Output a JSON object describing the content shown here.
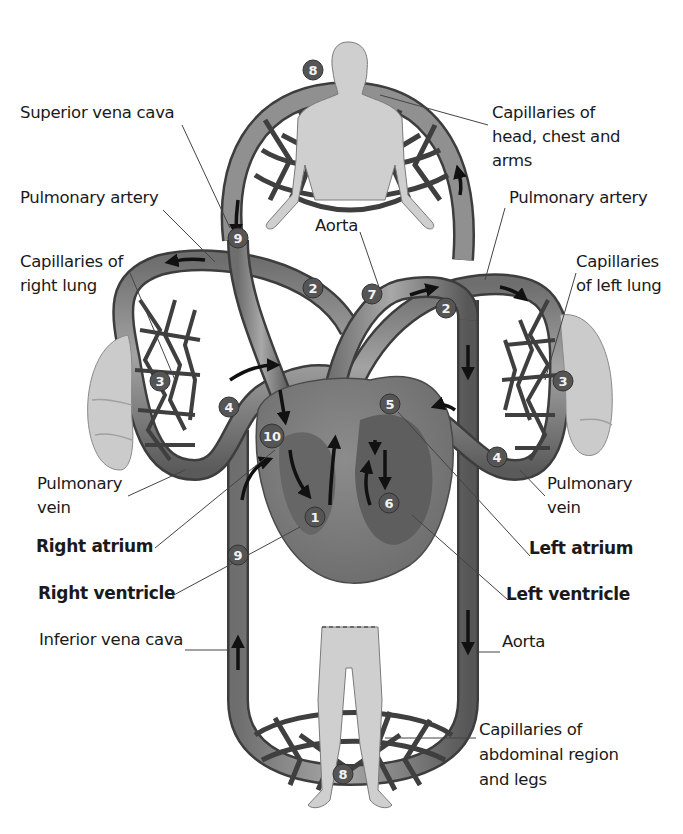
{
  "diagram": {
    "palette": {
      "background": "#ffffff",
      "vessel": "#8a8a8a",
      "vessel_dark": "#5a5a5a",
      "vessel_outline": "#3d3d3d",
      "capillary_net": "#3f3f3f",
      "heart": "#7d7d7d",
      "heart_dark": "#595959",
      "body_silhouette": "#cfcfcf",
      "lung": "#cbcbcb",
      "badge": "#555555",
      "arrow": "#111111",
      "leader_line": "#444444",
      "text": "#1a1a1a"
    },
    "labels": [
      {
        "id": "superior-vena-cava",
        "text": "Superior vena cava",
        "bold": false,
        "x": 20,
        "y": 113
      },
      {
        "id": "capillaries-head-1",
        "text": "Capillaries of",
        "bold": false,
        "x": 492,
        "y": 113
      },
      {
        "id": "capillaries-head-2",
        "text": "head, chest and",
        "bold": false,
        "x": 492,
        "y": 137
      },
      {
        "id": "capillaries-head-3",
        "text": "arms",
        "bold": false,
        "x": 492,
        "y": 161
      },
      {
        "id": "pulmonary-artery-left-label",
        "text": "Pulmonary artery",
        "bold": false,
        "x": 20,
        "y": 198
      },
      {
        "id": "pulmonary-artery-right-label",
        "text": "Pulmonary artery",
        "bold": false,
        "x": 509,
        "y": 198
      },
      {
        "id": "aorta-top",
        "text": "Aorta",
        "bold": false,
        "x": 315,
        "y": 226
      },
      {
        "id": "capillaries-right-lung-1",
        "text": "Capillaries of",
        "bold": false,
        "x": 20,
        "y": 262
      },
      {
        "id": "capillaries-right-lung-2",
        "text": "right lung",
        "bold": false,
        "x": 20,
        "y": 286
      },
      {
        "id": "capillaries-left-lung-1",
        "text": "Capillaries",
        "bold": false,
        "x": 576,
        "y": 262
      },
      {
        "id": "capillaries-left-lung-2",
        "text": "of left lung",
        "bold": false,
        "x": 576,
        "y": 286
      },
      {
        "id": "pulmonary-vein-left-1",
        "text": "Pulmonary",
        "bold": false,
        "x": 37,
        "y": 484
      },
      {
        "id": "pulmonary-vein-left-2",
        "text": "vein",
        "bold": false,
        "x": 37,
        "y": 508
      },
      {
        "id": "pulmonary-vein-right-1",
        "text": "Pulmonary",
        "bold": false,
        "x": 547,
        "y": 484
      },
      {
        "id": "pulmonary-vein-right-2",
        "text": "vein",
        "bold": false,
        "x": 547,
        "y": 508
      },
      {
        "id": "right-atrium",
        "text": "Right atrium",
        "bold": true,
        "x": 36,
        "y": 546
      },
      {
        "id": "left-atrium",
        "text": "Left atrium",
        "bold": true,
        "x": 529,
        "y": 548
      },
      {
        "id": "right-ventricle",
        "text": "Right ventricle",
        "bold": true,
        "x": 38,
        "y": 593
      },
      {
        "id": "left-ventricle",
        "text": "Left ventricle",
        "bold": true,
        "x": 506,
        "y": 594
      },
      {
        "id": "inferior-vena-cava",
        "text": "Inferior vena cava",
        "bold": false,
        "x": 39,
        "y": 640
      },
      {
        "id": "aorta-bottom",
        "text": "Aorta",
        "bold": false,
        "x": 502,
        "y": 642
      },
      {
        "id": "capillaries-abdomen-1",
        "text": "Capillaries of",
        "bold": false,
        "x": 479,
        "y": 730
      },
      {
        "id": "capillaries-abdomen-2",
        "text": "abdominal region",
        "bold": false,
        "x": 479,
        "y": 755
      },
      {
        "id": "capillaries-abdomen-3",
        "text": "and legs",
        "bold": false,
        "x": 479,
        "y": 780
      }
    ],
    "badges": [
      {
        "n": "8",
        "x": 313,
        "y": 70
      },
      {
        "n": "9",
        "x": 238,
        "y": 238
      },
      {
        "n": "2",
        "x": 313,
        "y": 288
      },
      {
        "n": "7",
        "x": 372,
        "y": 294
      },
      {
        "n": "2",
        "x": 446,
        "y": 308
      },
      {
        "n": "3",
        "x": 160,
        "y": 381
      },
      {
        "n": "3",
        "x": 563,
        "y": 381
      },
      {
        "n": "4",
        "x": 229,
        "y": 407
      },
      {
        "n": "5",
        "x": 390,
        "y": 404
      },
      {
        "n": "10",
        "x": 272,
        "y": 436
      },
      {
        "n": "4",
        "x": 497,
        "y": 457
      },
      {
        "n": "6",
        "x": 389,
        "y": 503
      },
      {
        "n": "1",
        "x": 315,
        "y": 517
      },
      {
        "n": "9",
        "x": 238,
        "y": 555
      },
      {
        "n": "8",
        "x": 343,
        "y": 774
      }
    ]
  }
}
